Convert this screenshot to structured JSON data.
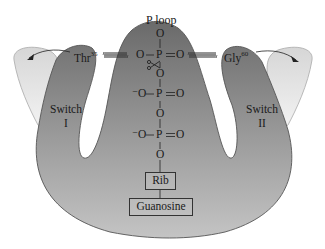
{
  "diagram": {
    "title_label": "P loop",
    "left_residue": {
      "name": "Thr",
      "number": "35"
    },
    "right_residue": {
      "name": "Gly",
      "number": "60"
    },
    "switch_1": {
      "line1": "Switch",
      "line2": "I"
    },
    "switch_2": {
      "line1": "Switch",
      "line2": "II"
    },
    "phosphate_chain": {
      "gamma": {
        "top_o": "O",
        "left": "O",
        "p": "P",
        "right": "O"
      },
      "bridge_1": "O",
      "beta": {
        "left": "⁻O",
        "p": "P",
        "right": "O"
      },
      "bridge_2": "O",
      "alpha": {
        "left": "⁻O",
        "p": "P",
        "right": "O"
      },
      "bridge_3": "O"
    },
    "ribose_label": "Rib",
    "base_label": "Guanosine",
    "cleavage_icon": "scissors",
    "colors": {
      "protein_dark": "#6e6e6e",
      "protein_light": "#c8c8c8",
      "switch_open": "#e4e4e4",
      "outline": "#555555",
      "text": "#1a1a1a"
    }
  }
}
